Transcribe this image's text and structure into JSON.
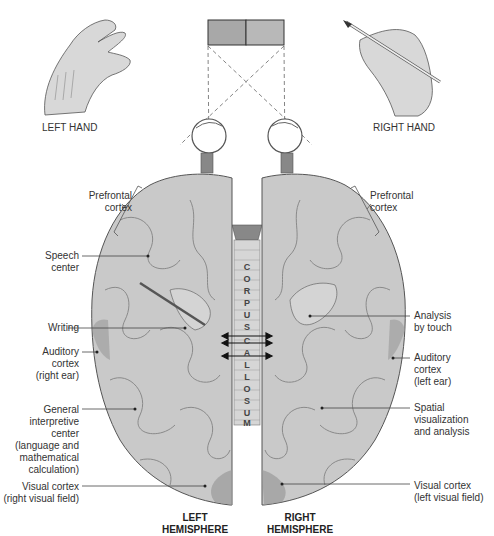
{
  "title_hands": {
    "left": "LEFT HAND",
    "right": "RIGHT HAND"
  },
  "visual_stimulus": {
    "left_color": "#a8a8a8",
    "right_color": "#b8b8b8"
  },
  "corpus_callosum_letters": [
    "C",
    "O",
    "R",
    "P",
    "U",
    "S",
    "C",
    "A",
    "L",
    "L",
    "O",
    "S",
    "U",
    "M"
  ],
  "hemispheres": {
    "left": [
      "LEFT",
      "HEMISPHERE"
    ],
    "right": [
      "RIGHT",
      "HEMISPHERE"
    ]
  },
  "labels_left": [
    {
      "id": "prefrontal-left",
      "lines": [
        "Prefrontal",
        "cortex"
      ]
    },
    {
      "id": "speech-center",
      "lines": [
        "Speech",
        "center"
      ]
    },
    {
      "id": "writing",
      "lines": [
        "Writing"
      ]
    },
    {
      "id": "auditory-left",
      "lines": [
        "Auditory",
        "cortex",
        "(right ear)"
      ]
    },
    {
      "id": "general-interpretive",
      "lines": [
        "General",
        "interpretive",
        "center",
        "(language and",
        "mathematical",
        "calculation)"
      ]
    },
    {
      "id": "visual-left",
      "lines": [
        "Visual cortex",
        "(right visual field)"
      ]
    }
  ],
  "labels_right": [
    {
      "id": "prefrontal-right",
      "lines": [
        "Prefrontal",
        "cortex"
      ]
    },
    {
      "id": "analysis-touch",
      "lines": [
        "Analysis",
        "by touch"
      ]
    },
    {
      "id": "auditory-right",
      "lines": [
        "Auditory",
        "cortex",
        "(left ear)"
      ]
    },
    {
      "id": "spatial",
      "lines": [
        "Spatial",
        "visualization",
        "and analysis"
      ]
    },
    {
      "id": "visual-right",
      "lines": [
        "Visual cortex",
        "(left visual field)"
      ]
    }
  ],
  "colors": {
    "brain_fill": "#c9c9c9",
    "brain_stroke": "#555555",
    "shade": "#9a9a9a",
    "line": "#444444"
  }
}
